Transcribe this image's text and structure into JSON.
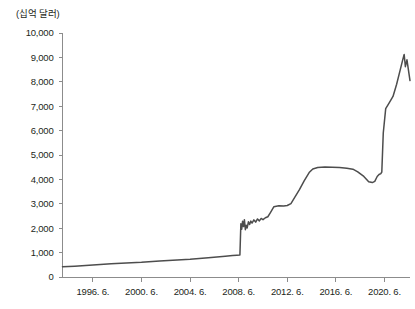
{
  "chart_data": {
    "type": "line",
    "title": "",
    "subtitle": "",
    "unit_label": "(십억 달러)",
    "xlabel": "",
    "ylabel": "",
    "ylim": [
      0,
      10000
    ],
    "ytick_labels": [
      "10,000",
      "9,000",
      "8,000",
      "7,000",
      "6,000",
      "5,000",
      "4,000",
      "3,000",
      "2,000",
      "1,000",
      "0"
    ],
    "ytick_values": [
      10000,
      9000,
      8000,
      7000,
      6000,
      5000,
      4000,
      3000,
      2000,
      1000,
      0
    ],
    "xtick_labels": [
      "1996. 6.",
      "2000. 6.",
      "2004. 6.",
      "2008. 6.",
      "2012. 6.",
      "2016. 6.",
      "2020. 6."
    ],
    "xtick_values": [
      1996.5,
      2000.5,
      2004.5,
      2008.5,
      2012.5,
      2016.5,
      2020.5
    ],
    "xlim": [
      1994.0,
      2022.6
    ],
    "grid": false,
    "legend": null,
    "legend_position": "none",
    "line_color": "#4d4d4d",
    "axis_color": "#8c8c8c",
    "text_color": "#231f20",
    "series": [
      {
        "name": "balance",
        "x": [
          1994.0,
          1995.0,
          1996.5,
          1998.0,
          2000.5,
          2002.0,
          2004.5,
          2006.0,
          2007.4,
          2008.0,
          2008.35,
          2008.6,
          2008.68,
          2008.75,
          2008.82,
          2008.9,
          2008.97,
          2009.05,
          2009.12,
          2009.2,
          2009.3,
          2009.4,
          2009.5,
          2009.6,
          2009.75,
          2009.9,
          2010.05,
          2010.2,
          2010.35,
          2010.5,
          2010.7,
          2010.9,
          2011.1,
          2011.4,
          2011.8,
          2012.2,
          2012.5,
          2012.8,
          2013.1,
          2013.5,
          2013.9,
          2014.3,
          2014.6,
          2015.0,
          2015.6,
          2016.2,
          2016.8,
          2017.4,
          2017.9,
          2018.3,
          2018.8,
          2019.2,
          2019.5,
          2019.7,
          2019.9,
          2020.05,
          2020.2,
          2020.28,
          2020.4,
          2020.6,
          2020.9,
          2021.2,
          2021.5,
          2021.8,
          2022.0,
          2022.12,
          2022.22,
          2022.35,
          2022.6
        ],
        "y": [
          420,
          445,
          490,
          540,
          600,
          660,
          730,
          790,
          850,
          880,
          890,
          900,
          2180,
          1960,
          2280,
          2070,
          2350,
          1940,
          2120,
          2010,
          2260,
          2150,
          2290,
          2210,
          2340,
          2250,
          2380,
          2300,
          2400,
          2350,
          2430,
          2470,
          2630,
          2880,
          2920,
          2910,
          2930,
          3010,
          3250,
          3580,
          3950,
          4280,
          4430,
          4490,
          4510,
          4500,
          4490,
          4460,
          4420,
          4310,
          4120,
          3900,
          3870,
          3920,
          4120,
          4200,
          4240,
          4300,
          5900,
          6900,
          7150,
          7400,
          7900,
          8500,
          8900,
          9120,
          8620,
          8900,
          8050
        ]
      }
    ]
  }
}
